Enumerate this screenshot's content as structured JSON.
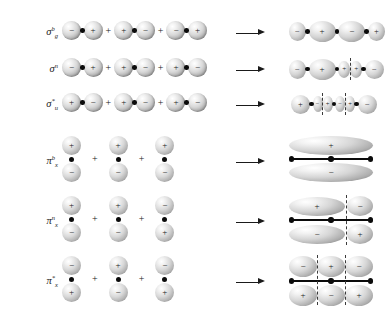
{
  "figure": {
    "top_artifact": "",
    "operator_plus": "+",
    "sign_positive": "+",
    "sign_negative": "−",
    "arrow_glyph": "⟶",
    "colors": {
      "ink": "#1a1a1a",
      "nucleus": "#0b0b0b",
      "node_line": "#3a3a3a",
      "orbital_light": "#ffffff",
      "orbital_shade": "#7a7a7a",
      "background": "#ffffff"
    }
  },
  "rows": [
    {
      "id": "sigma-b-g",
      "type": "sigma",
      "label": {
        "symbol": "σ",
        "superscript": "b",
        "subscript": "g",
        "text": "σᵇg"
      },
      "lhs_atoms": [
        {
          "left_sign": "−",
          "right_sign": "+"
        },
        {
          "left_sign": "+",
          "right_sign": "−"
        },
        {
          "left_sign": "−",
          "right_sign": "+"
        }
      ],
      "result_signs": [
        "−",
        "+",
        "−",
        "+"
      ],
      "result_nodes": 0
    },
    {
      "id": "sigma-n",
      "type": "sigma",
      "label": {
        "symbol": "σ",
        "superscript": "n",
        "subscript": "",
        "text": "σⁿ"
      },
      "lhs_atoms": [
        {
          "left_sign": "−",
          "right_sign": "+"
        },
        {
          "left_sign": "+",
          "right_sign": "−"
        },
        {
          "left_sign": "+",
          "right_sign": "−"
        }
      ],
      "result_signs": [
        "−",
        "+",
        "+",
        "−"
      ],
      "result_nodes": 1
    },
    {
      "id": "sigma-star-u",
      "type": "sigma",
      "label": {
        "symbol": "σ",
        "superscript": "*",
        "subscript": "u",
        "text": "σ*u"
      },
      "lhs_atoms": [
        {
          "left_sign": "+",
          "right_sign": "−"
        },
        {
          "left_sign": "+",
          "right_sign": "−"
        },
        {
          "left_sign": "+",
          "right_sign": "−"
        }
      ],
      "result_signs": [
        "+",
        "−",
        "+",
        "−",
        "+",
        "−"
      ],
      "result_nodes": 3
    },
    {
      "id": "pi-b-x",
      "type": "pi",
      "label": {
        "symbol": "π",
        "superscript": "b",
        "subscript": "x",
        "text": "πᵇx"
      },
      "lhs_atoms": [
        {
          "top_sign": "+",
          "bottom_sign": "−"
        },
        {
          "top_sign": "+",
          "bottom_sign": "−"
        },
        {
          "top_sign": "+",
          "bottom_sign": "−"
        }
      ],
      "result_top": [
        "+"
      ],
      "result_bottom": [
        "−"
      ],
      "result_nodes": 0
    },
    {
      "id": "pi-n-x",
      "type": "pi",
      "label": {
        "symbol": "π",
        "superscript": "n",
        "subscript": "x",
        "text": "πⁿx"
      },
      "lhs_atoms": [
        {
          "top_sign": "+",
          "bottom_sign": "−"
        },
        {
          "top_sign": "+",
          "bottom_sign": "−"
        },
        {
          "top_sign": "−",
          "bottom_sign": "+"
        }
      ],
      "result_top": [
        "+",
        "−"
      ],
      "result_bottom": [
        "−",
        "+"
      ],
      "result_nodes": 1
    },
    {
      "id": "pi-star-x",
      "type": "pi",
      "label": {
        "symbol": "π",
        "superscript": "*",
        "subscript": "x",
        "text": "π*x"
      },
      "lhs_atoms": [
        {
          "top_sign": "−",
          "bottom_sign": "+"
        },
        {
          "top_sign": "+",
          "bottom_sign": "−"
        },
        {
          "top_sign": "−",
          "bottom_sign": "+"
        }
      ],
      "result_top": [
        "−",
        "+",
        "−"
      ],
      "result_bottom": [
        "+",
        "−",
        "+"
      ],
      "result_nodes": 2
    }
  ]
}
